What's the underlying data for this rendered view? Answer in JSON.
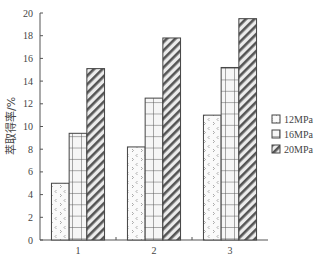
{
  "chart_data": {
    "type": "bar",
    "title": "",
    "xlabel": "",
    "ylabel": "萃取得率/%",
    "categories": [
      "1",
      "2",
      "3"
    ],
    "series": [
      {
        "name": "12MPa",
        "pattern": "chevron-dots",
        "values": [
          5.0,
          8.2,
          11.0
        ]
      },
      {
        "name": "16MPa",
        "pattern": "grid",
        "values": [
          9.4,
          12.5,
          15.2
        ]
      },
      {
        "name": "20MPa",
        "pattern": "diagonal-hatch",
        "values": [
          15.1,
          17.8,
          19.5
        ]
      }
    ],
    "ylim": [
      0,
      20
    ],
    "yticks": [
      0,
      2,
      4,
      6,
      8,
      10,
      12,
      14,
      16,
      18,
      20
    ],
    "grid": false,
    "legend_position": "right"
  },
  "colors": {
    "axis": "#555555",
    "bar_outline": "#444444",
    "hatch": "#555555",
    "text": "#444444"
  }
}
